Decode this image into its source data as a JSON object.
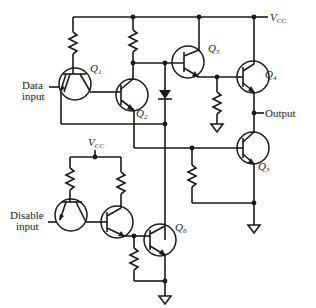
{
  "diagram": {
    "type": "tri-state TTL gate schematic",
    "supply_label": {
      "main": "V",
      "sub": "CC"
    },
    "labels": {
      "data_input": [
        "Data",
        "input"
      ],
      "disable_input": [
        "Disable",
        "input"
      ],
      "output": "Output"
    },
    "transistors": [
      {
        "id": "Q1",
        "letter": "Q",
        "sub": "1",
        "kind": "npn multi-emitter"
      },
      {
        "id": "Q2",
        "letter": "Q",
        "sub": "2",
        "kind": "npn"
      },
      {
        "id": "Q3",
        "letter": "Q",
        "sub": "3",
        "kind": "npn"
      },
      {
        "id": "Q4",
        "letter": "Q",
        "sub": "4",
        "kind": "npn"
      },
      {
        "id": "Q5",
        "letter": "Q",
        "sub": "5",
        "kind": "npn"
      },
      {
        "id": "Q6",
        "letter": "Q",
        "sub": "6",
        "kind": "npn"
      }
    ],
    "components": [
      "resistor",
      "diode",
      "ground"
    ],
    "colors": {
      "ink": "#1a1a1a",
      "background": "#ffffff"
    }
  }
}
